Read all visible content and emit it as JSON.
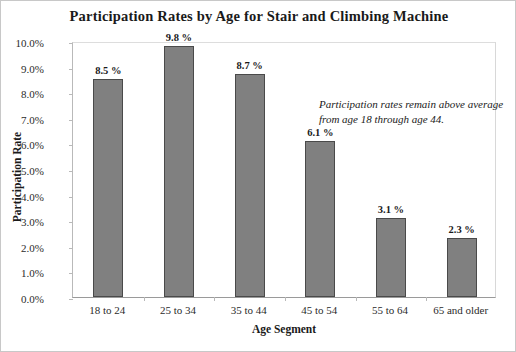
{
  "chart_data": {
    "type": "bar",
    "title": "Participation Rates by Age for Stair and Climbing Machine",
    "xlabel": "Age Segment",
    "ylabel": "Participation Rate",
    "categories": [
      "18 to 24",
      "25 to 34",
      "35 to 44",
      "45 to 54",
      "55 to 64",
      "65 and older"
    ],
    "values": [
      8.5,
      9.8,
      8.7,
      6.1,
      3.1,
      2.3
    ],
    "value_labels": [
      "8.5 %",
      "9.8 %",
      "8.7 %",
      "6.1 %",
      "3.1 %",
      "2.3 %"
    ],
    "ylim": [
      0,
      10
    ],
    "ytick_values": [
      0,
      1,
      2,
      3,
      4,
      5,
      6,
      7,
      8,
      9,
      10
    ],
    "ytick_labels": [
      "0.0%",
      "1.0%",
      "2.0%",
      "3.0%",
      "4.0%",
      "5.0%",
      "6.0%",
      "7.0%",
      "8.0%",
      "9.0%",
      "10.0%"
    ],
    "grid": false,
    "legend": false,
    "annotations": [
      "Participation rates remain above average from age 18 through age 44."
    ],
    "colors": {
      "bar_fill": "#808080",
      "bar_border": "#4a4a4a",
      "text": "#1a1a1a",
      "background": "#ffffff",
      "frame": "#c8c8c8"
    }
  }
}
